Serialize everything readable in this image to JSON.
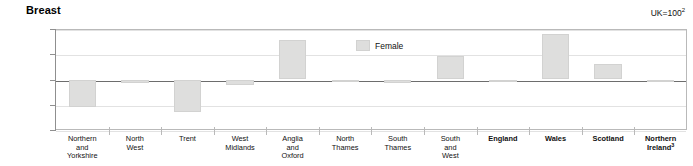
{
  "chart_data": {
    "type": "bar",
    "title": "Breast",
    "subtitle": "",
    "note": "UK=100",
    "note_superscript": "2",
    "xlabel": "",
    "ylabel": "",
    "ylim": [
      80,
      120
    ],
    "yticks": [
      80,
      90,
      100,
      110,
      120
    ],
    "baseline": 100,
    "grid": true,
    "legend_position": "inside-center",
    "legend": [
      "Female"
    ],
    "categories": [
      "Northern and Yorkshire",
      "North West",
      "Trent",
      "West Midlands",
      "Anglia and Oxford",
      "North Thames",
      "South Thames",
      "South and West",
      "England",
      "Wales",
      "Scotland",
      "Northern Ireland"
    ],
    "category_lines": [
      [
        "Northern",
        "and",
        "Yorkshire"
      ],
      [
        "North",
        "West"
      ],
      [
        "Trent"
      ],
      [
        "West",
        "Midlands"
      ],
      [
        "Anglia",
        "and",
        "Oxford"
      ],
      [
        "North",
        "Thames"
      ],
      [
        "South",
        "Thames"
      ],
      [
        "South",
        "and",
        "West"
      ],
      [
        "England"
      ],
      [
        "Wales"
      ],
      [
        "Scotland"
      ],
      [
        "Northern",
        "Ireland"
      ]
    ],
    "category_bold": [
      false,
      false,
      false,
      false,
      false,
      false,
      false,
      false,
      true,
      true,
      true,
      true
    ],
    "category_superscripts": [
      "",
      "",
      "",
      "",
      "",
      "",
      "",
      "",
      "",
      "",
      "",
      "3"
    ],
    "series": [
      {
        "name": "Female",
        "values": [
          89.0,
          98.5,
          87.0,
          98.0,
          115.5,
          99.0,
          98.5,
          109.5,
          99.0,
          118.0,
          106.0,
          100.0
        ]
      }
    ],
    "colors": {
      "bar_fill": "#dededd",
      "bar_stroke": "#d2d2d1",
      "gridline": "#e2e2e2",
      "baseline": "#6d6d6d",
      "frame": "#b9b9b9",
      "text": "#111111"
    }
  }
}
